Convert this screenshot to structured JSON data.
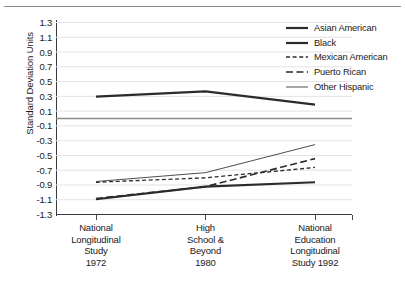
{
  "chart_data": {
    "type": "line",
    "title": "",
    "xlabel": "",
    "ylabel": "Standard Deviation Units",
    "categories": [
      "National\nLongitudinal\nStudy\n1972",
      "High\nSchool &\nBeyond\n1980",
      "National\nEducation\nLongitudinal\nStudy 1992"
    ],
    "category_lines": [
      [
        "National",
        "Longitudinal",
        "Study",
        "1972"
      ],
      [
        "High",
        "School &",
        "Beyond",
        "1980"
      ],
      [
        "National",
        "Education",
        "Longitudinal",
        "Study 1992"
      ]
    ],
    "ylim": [
      -1.3,
      1.3
    ],
    "ytick_step": 0.2,
    "yticks": [
      "1.3",
      "1.1",
      "0.9",
      "0.7",
      "0.5",
      "0.3",
      "0.1",
      "-0.1",
      "-0.3",
      "-0.5",
      "-0.7",
      "-0.9",
      "-1.1",
      "-1.3"
    ],
    "ytick_values": [
      1.3,
      1.1,
      0.9,
      0.7,
      0.5,
      0.3,
      0.1,
      -0.1,
      -0.3,
      -0.5,
      -0.7,
      -0.9,
      -1.1,
      -1.3
    ],
    "grid": true,
    "zero_line": 0,
    "legend_position": "top-right",
    "series": [
      {
        "name": "Asian American",
        "values": [
          0.29,
          0.36,
          0.18
        ],
        "style": "solid",
        "width": 2.2,
        "color": "#2b2b2b"
      },
      {
        "name": "Black",
        "values": [
          -1.1,
          -0.93,
          -0.87
        ],
        "style": "solid",
        "width": 2.2,
        "color": "#2b2b2b"
      },
      {
        "name": "Mexican American",
        "values": [
          -0.87,
          -0.81,
          -0.67
        ],
        "style": "short-dash",
        "width": 1.3,
        "color": "#2b2b2b"
      },
      {
        "name": "Puerto Rican",
        "values": [
          -1.09,
          -0.93,
          -0.55
        ],
        "style": "long-dash",
        "width": 1.6,
        "color": "#2b2b2b"
      },
      {
        "name": "Other Hispanic",
        "values": [
          -0.86,
          -0.74,
          -0.36
        ],
        "style": "solid",
        "width": 0.9,
        "color": "#3a3a3a"
      }
    ]
  },
  "colors": {
    "axis": "#3a3a3a",
    "grid": "#e3e3e3",
    "zero_line": "#8c8c8c",
    "text": "#1a1a1a",
    "top_rule": "#8c8c8c"
  }
}
